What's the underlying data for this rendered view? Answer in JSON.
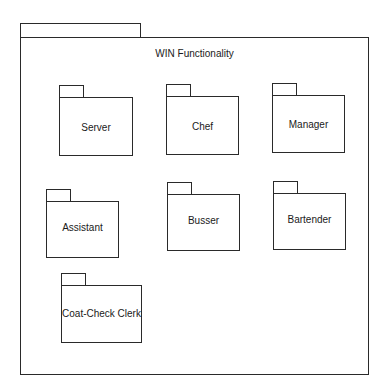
{
  "diagram": {
    "type": "uml-package-diagram",
    "container": {
      "title": "WIN Functionality",
      "tab": {
        "x": 20,
        "y": 23,
        "w": 121,
        "h": 16
      },
      "body": {
        "x": 20,
        "y": 37,
        "w": 349,
        "h": 338
      }
    },
    "packages": [
      {
        "name": "Server",
        "tab": {
          "x": 59,
          "y": 85,
          "w": 25,
          "h": 14
        },
        "body": {
          "x": 59,
          "y": 97,
          "w": 74,
          "h": 59
        },
        "label_top": 24
      },
      {
        "name": "Chef",
        "tab": {
          "x": 166,
          "y": 84,
          "w": 25,
          "h": 14
        },
        "body": {
          "x": 166,
          "y": 96,
          "w": 73,
          "h": 59
        },
        "label_top": 24
      },
      {
        "name": "Manager",
        "tab": {
          "x": 272,
          "y": 83,
          "w": 25,
          "h": 14
        },
        "body": {
          "x": 272,
          "y": 95,
          "w": 73,
          "h": 58
        },
        "label_top": 23
      },
      {
        "name": "Assistant",
        "tab": {
          "x": 46,
          "y": 189,
          "w": 25,
          "h": 14
        },
        "body": {
          "x": 46,
          "y": 201,
          "w": 73,
          "h": 57
        },
        "label_top": 20
      },
      {
        "name": "Busser",
        "tab": {
          "x": 167,
          "y": 182,
          "w": 25,
          "h": 14
        },
        "body": {
          "x": 167,
          "y": 194,
          "w": 73,
          "h": 57
        },
        "label_top": 20
      },
      {
        "name": "Bartender",
        "tab": {
          "x": 273,
          "y": 181,
          "w": 25,
          "h": 14
        },
        "body": {
          "x": 273,
          "y": 193,
          "w": 73,
          "h": 57
        },
        "label_top": 20
      },
      {
        "name": "Coat-Check Clerk",
        "tab": {
          "x": 61,
          "y": 273,
          "w": 25,
          "h": 14
        },
        "body": {
          "x": 61,
          "y": 285,
          "w": 81,
          "h": 58
        },
        "label_top": 22
      }
    ]
  }
}
